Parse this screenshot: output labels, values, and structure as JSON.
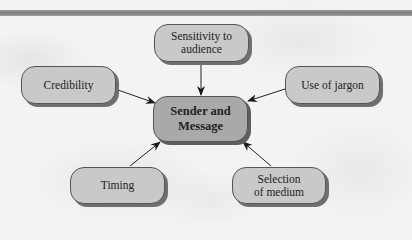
{
  "diagram": {
    "type": "hub-and-spoke",
    "colors": {
      "header_bar": "#8a8a8a",
      "node_fill": "#c9c9c9",
      "center_fill": "#a9a9a9",
      "shadow": "#6f6f6f",
      "arrow": "#222222"
    },
    "center": {
      "label": "Sender and\nMessage"
    },
    "nodes": [
      {
        "id": "sensitivity",
        "label": "Sensitivity to\naudience"
      },
      {
        "id": "credibility",
        "label": "Credibility"
      },
      {
        "id": "jargon",
        "label": "Use of jargon"
      },
      {
        "id": "timing",
        "label": "Timing"
      },
      {
        "id": "medium",
        "label": "Selection\nof medium"
      }
    ],
    "edges": [
      {
        "from": "sensitivity",
        "to": "center"
      },
      {
        "from": "credibility",
        "to": "center"
      },
      {
        "from": "jargon",
        "to": "center"
      },
      {
        "from": "timing",
        "to": "center"
      },
      {
        "from": "medium",
        "to": "center"
      }
    ]
  }
}
